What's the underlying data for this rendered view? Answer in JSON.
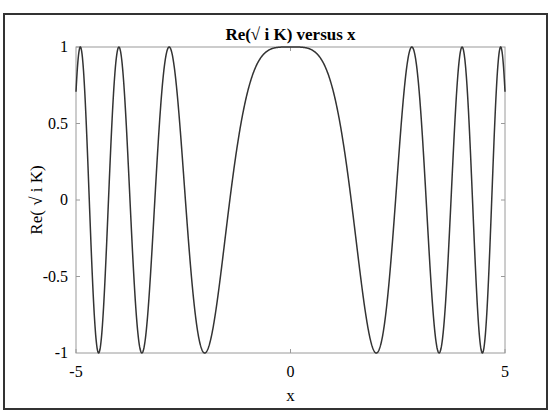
{
  "figure": {
    "title": "Re(√ i K) versus x",
    "xlabel": "x",
    "ylabel": "Re( √ i K)",
    "xticks": [
      "-5",
      "0",
      "5"
    ],
    "yticks": [
      "1",
      "0.5",
      "0",
      "-0.5",
      "-1"
    ],
    "colors": {
      "line": "#333333",
      "axes": "#9a9a9a",
      "frame": "#333333"
    }
  },
  "chart_data": {
    "type": "line",
    "title": "Re(√ i K) versus x",
    "xlabel": "x",
    "ylabel": "Re( √ i K)",
    "xlim": [
      -5,
      5
    ],
    "ylim": [
      -1,
      1
    ],
    "grid": false,
    "legend": null,
    "xticks": [
      -5,
      0,
      5
    ],
    "yticks": [
      -1,
      -0.5,
      0,
      0.5,
      1
    ],
    "series": [
      {
        "name": "Re(√ i K)",
        "x": [
          -5,
          -4.9,
          -4.75,
          -4.47,
          -4.25,
          -4,
          -3.75,
          -3.46,
          -3.2,
          -2.83,
          -2.45,
          -2,
          -1.5,
          -1,
          -0.5,
          0,
          0.5,
          1,
          1.5,
          2,
          2.45,
          2.83,
          3.2,
          3.46,
          3.75,
          4,
          4.25,
          4.47,
          4.75,
          4.9,
          5
        ],
        "y": [
          0.71,
          1,
          0.2,
          -1,
          0.1,
          1,
          -0.3,
          -1,
          0.2,
          1,
          0.0,
          -1,
          -0.38,
          0.71,
          0.98,
          1,
          0.98,
          0.71,
          -0.38,
          -1,
          0.0,
          1,
          0.2,
          -1,
          -0.3,
          1,
          0.1,
          -1,
          0.2,
          1,
          0.71
        ]
      }
    ],
    "annotations": []
  }
}
